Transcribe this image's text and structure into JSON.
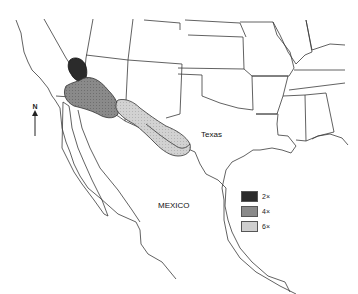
{
  "map": {
    "labels": {
      "texas": "Texas",
      "mexico": "MEXICO"
    },
    "north_arrow": {
      "label": "N"
    },
    "legend": {
      "items": [
        {
          "label": "2×",
          "color": "#2b2b2b"
        },
        {
          "label": "4×",
          "color": "#8a8a8a"
        },
        {
          "label": "6×",
          "color": "#cfcfcf"
        }
      ]
    },
    "regions": [
      {
        "level": "2×",
        "color": "#2b2b2b"
      },
      {
        "level": "4×",
        "color": "#8a8a8a"
      },
      {
        "level": "6×",
        "color": "#cfcfcf"
      }
    ]
  }
}
